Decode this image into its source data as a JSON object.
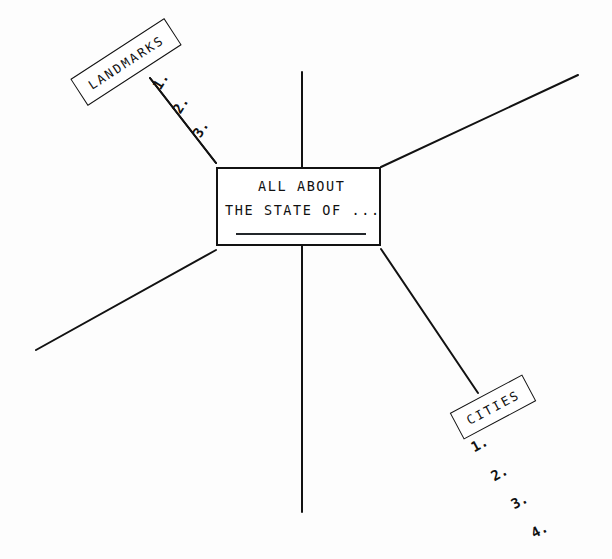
{
  "diagram": {
    "type": "mind-map",
    "title": "ALL ABOUT THE STATE OF ...",
    "background_color": "#fdfdfd",
    "ink_color": "#121212",
    "center": {
      "line1": "ALL ABOUT",
      "line2": "THE STATE OF ...",
      "has_underline_rule": true
    },
    "branches": [
      {
        "id": "landmarks",
        "label": "LANDMARKS",
        "label_rotation_deg": -33,
        "direction": "upper-left",
        "items": [
          "1.",
          "2.",
          "3."
        ]
      },
      {
        "id": "cities",
        "label": "CITIES",
        "label_rotation_deg": -28,
        "direction": "lower-right",
        "items": [
          "1.",
          "2.",
          "3.",
          "4."
        ]
      },
      {
        "id": "branch-top",
        "label": "",
        "direction": "up",
        "items": []
      },
      {
        "id": "branch-upper-right",
        "label": "",
        "direction": "upper-right",
        "items": []
      },
      {
        "id": "branch-lower-left",
        "label": "",
        "direction": "lower-left",
        "items": []
      },
      {
        "id": "branch-bottom",
        "label": "",
        "direction": "down",
        "items": []
      }
    ]
  }
}
